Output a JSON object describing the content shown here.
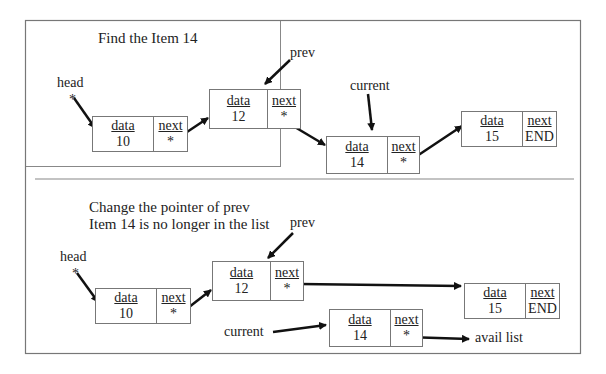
{
  "panel_top": {
    "title": "Find the Item 14",
    "labels": {
      "head": "head",
      "prev": "prev",
      "current": "current",
      "head_star": "*"
    },
    "nodes": [
      {
        "data_label": "data",
        "next_label": "next",
        "value": "10",
        "next_value": "*"
      },
      {
        "data_label": "data",
        "next_label": "next",
        "value": "12",
        "next_value": "*"
      },
      {
        "data_label": "data",
        "next_label": "next",
        "value": "14",
        "next_value": "*"
      },
      {
        "data_label": "data",
        "next_label": "next",
        "value": "15",
        "next_value": "END"
      }
    ]
  },
  "panel_bottom": {
    "title_line1": "Change the pointer of prev",
    "title_line2": "Item 14 is no longer in the list",
    "labels": {
      "head": "head",
      "prev": "prev",
      "current": "current",
      "head_star": "*",
      "avail": "avail list"
    },
    "nodes": [
      {
        "data_label": "data",
        "next_label": "next",
        "value": "10",
        "next_value": "*"
      },
      {
        "data_label": "data",
        "next_label": "next",
        "value": "12",
        "next_value": "*"
      },
      {
        "data_label": "data",
        "next_label": "next",
        "value": "14",
        "next_value": "*"
      },
      {
        "data_label": "data",
        "next_label": "next",
        "value": "15",
        "next_value": "END"
      }
    ]
  },
  "colors": {
    "border": "#777777",
    "arrow": "#111111",
    "text": "#222222"
  }
}
